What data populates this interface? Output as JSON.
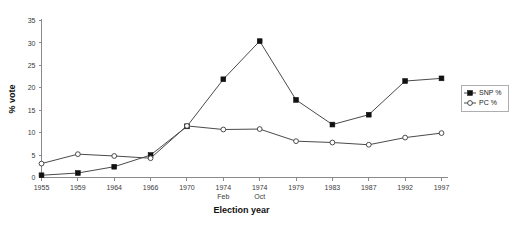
{
  "chart_data": {
    "type": "line",
    "title": "",
    "xlabel": "Election year",
    "ylabel": "% vote",
    "categories": [
      "1955",
      "1959",
      "1964",
      "1966",
      "1970",
      "1974 Feb",
      "1974 Oct",
      "1979",
      "1983",
      "1987",
      "1992",
      "1997"
    ],
    "category_lines": [
      [
        "1955",
        ""
      ],
      [
        "1959",
        ""
      ],
      [
        "1964",
        ""
      ],
      [
        "1966",
        ""
      ],
      [
        "1970",
        ""
      ],
      [
        "1974",
        "Feb"
      ],
      [
        "1974",
        "Oct"
      ],
      [
        "1979",
        ""
      ],
      [
        "1983",
        ""
      ],
      [
        "1987",
        ""
      ],
      [
        "1992",
        ""
      ],
      [
        "1997",
        ""
      ]
    ],
    "series": [
      {
        "name": "SNP %",
        "marker": "filled-square",
        "color": "#111111",
        "values": [
          0.5,
          1.0,
          2.4,
          5.0,
          11.4,
          21.9,
          30.4,
          17.3,
          11.8,
          14.0,
          21.5,
          22.1
        ]
      },
      {
        "name": "PC %",
        "marker": "open-circle",
        "color": "#3a3a3a",
        "values": [
          3.1,
          5.2,
          4.8,
          4.3,
          11.5,
          10.7,
          10.8,
          8.1,
          7.8,
          7.3,
          8.9,
          9.9
        ]
      }
    ],
    "ylim": [
      0,
      35
    ],
    "yticks": [
      0,
      5,
      10,
      15,
      20,
      25,
      30,
      35
    ],
    "grid": false,
    "legend_position": "right",
    "legend_entries": [
      "SNP %",
      "PC %"
    ]
  },
  "legend": {
    "items": [
      {
        "label": "SNP %",
        "marker": "filled-square"
      },
      {
        "label": "PC %",
        "marker": "open-circle"
      }
    ]
  }
}
